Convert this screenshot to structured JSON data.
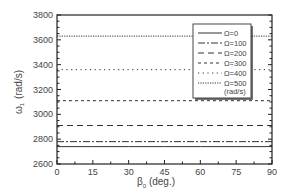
{
  "chart_data": {
    "type": "line",
    "title": "",
    "xlabel": "β0 (deg.)",
    "xlabel_main": "β",
    "xlabel_sub": "0",
    "xlabel_unit": " (deg.)",
    "ylabel": "ω1 (rad/s)",
    "ylabel_main": "ω",
    "ylabel_sub": "1",
    "ylabel_unit": "(rad/s)",
    "xlim": [
      0,
      90
    ],
    "ylim": [
      2600,
      3800
    ],
    "xticks": [
      0,
      15,
      30,
      45,
      60,
      75,
      90
    ],
    "yticks": [
      2600,
      2800,
      3000,
      3200,
      3400,
      3600,
      3800
    ],
    "grid": false,
    "legend_position": "upper right (inside)",
    "legend_note": "(rad/s)",
    "x": [
      0,
      15,
      30,
      45,
      60,
      75,
      90
    ],
    "series": [
      {
        "name": "Ω=0",
        "style": "solid",
        "values": [
          2740,
          2740,
          2740,
          2740,
          2740,
          2740,
          2740
        ]
      },
      {
        "name": "Ω=100",
        "style": "dash-dot",
        "values": [
          2780,
          2780,
          2780,
          2780,
          2780,
          2780,
          2780
        ]
      },
      {
        "name": "Ω=200",
        "style": "long-dash",
        "values": [
          2910,
          2910,
          2910,
          2910,
          2910,
          2910,
          2910
        ]
      },
      {
        "name": "Ω=300",
        "style": "short-dash",
        "values": [
          3110,
          3110,
          3110,
          3110,
          3110,
          3110,
          3110
        ]
      },
      {
        "name": "Ω=400",
        "style": "sparse-dot",
        "values": [
          3360,
          3360,
          3360,
          3360,
          3360,
          3360,
          3360
        ]
      },
      {
        "name": "Ω=500",
        "style": "dense-dot",
        "values": [
          3630,
          3630,
          3630,
          3630,
          3630,
          3630,
          3630
        ]
      }
    ]
  },
  "colors": {
    "line": "#333333",
    "axis": "#222222",
    "text": "#444444",
    "background": "#ffffff"
  }
}
